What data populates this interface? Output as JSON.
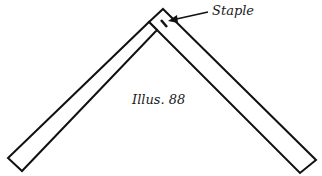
{
  "figure": {
    "staple_label": "Staple",
    "caption": "Illus. 88",
    "stroke_color": "#111111",
    "background": "#ffffff"
  }
}
